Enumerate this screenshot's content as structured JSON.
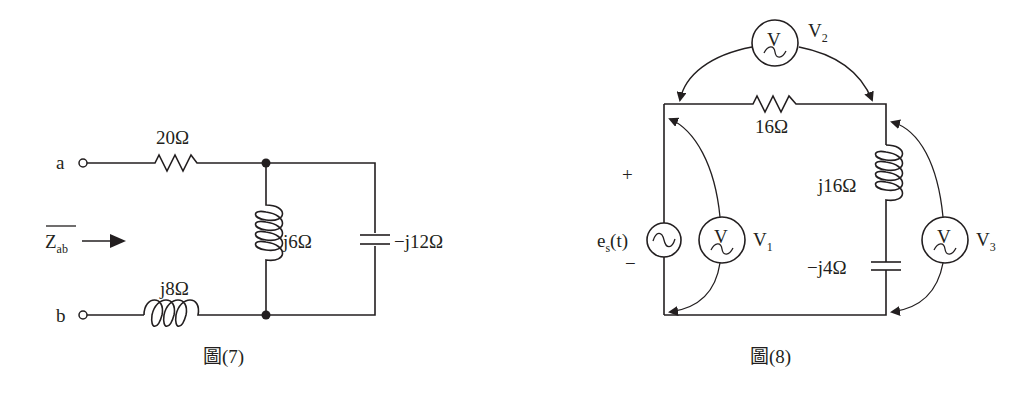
{
  "figure7": {
    "caption": "圖(7)",
    "terminal_a": "a",
    "terminal_b": "b",
    "impedance_label": "Z",
    "impedance_sub": "ab",
    "resistor_label": "20Ω",
    "series_inductor_label": "j8Ω",
    "shunt_inductor_label": "j6Ω",
    "capacitor_label": "−j12Ω"
  },
  "figure8": {
    "caption": "圖(8)",
    "source_label": "e",
    "source_sub": "s",
    "source_arg": "(t)",
    "plus": "+",
    "minus": "−",
    "resistor_label": "16Ω",
    "inductor_label": "j16Ω",
    "capacitor_label": "−j4Ω",
    "meter_glyph": "V",
    "voltmeters": [
      {
        "name": "V",
        "sub": "1"
      },
      {
        "name": "V",
        "sub": "2"
      },
      {
        "name": "V",
        "sub": "3"
      }
    ]
  }
}
